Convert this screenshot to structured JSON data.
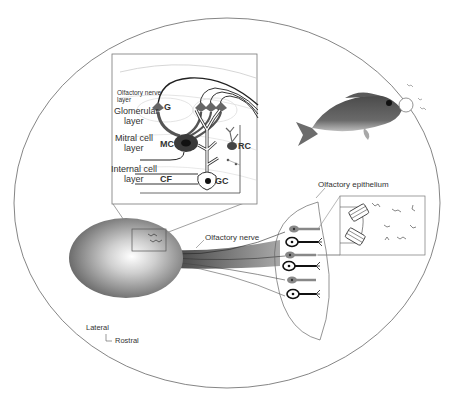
{
  "diagram": {
    "labels": {
      "olfactory_nerve_layer_1": "Olfactory nerve",
      "olfactory_nerve_layer_2": "layer",
      "glomerular_layer_1": "Glomerular",
      "glomerular_layer_2": "layer",
      "mitral_cell_layer_1": "Mitral cell",
      "mitral_cell_layer_2": "layer",
      "internal_cell_layer_1": "Internal cell",
      "internal_cell_layer_2": "layer",
      "g": "G",
      "mc": "MC",
      "rc": "RC",
      "gc": "GC",
      "cf": "CF",
      "olfactory_nerve": "Olfactory nerve",
      "olfactory_epithelium": "Olfactory epithelium",
      "lateral": "Lateral",
      "rostral": "Rostral"
    },
    "colors": {
      "outline": "#555555",
      "neuron_dark": "#2a2a2a",
      "neuron_gray": "#777777",
      "bulb": "#8a8a8a",
      "fish": "#5a5a5a"
    }
  }
}
